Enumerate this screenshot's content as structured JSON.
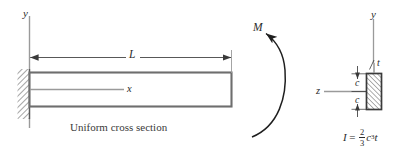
{
  "figure": {
    "caption": "Uniform cross section",
    "labels": {
      "y_axis_left": "y",
      "x_axis": "x",
      "span_length": "L",
      "moment": "M",
      "y_axis_right": "y",
      "z_axis": "z",
      "c_upper": "c",
      "c_lower": "c",
      "thickness": "t"
    },
    "formula": {
      "lhs": "I",
      "equals": "=",
      "numerator": "2",
      "denominator": "3",
      "var_c": "c",
      "exponent": "3",
      "var_t": "t"
    },
    "colors": {
      "line": "#3a3a3a",
      "beam_outline": "#6e6e6e",
      "hatch": "#5a5a5a",
      "text": "#2b2b2b",
      "background": "#ffffff",
      "thin_line": "#9a9a9a"
    }
  }
}
